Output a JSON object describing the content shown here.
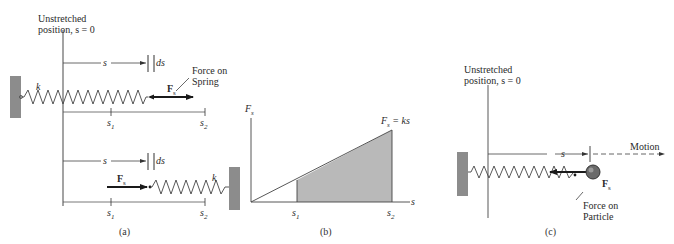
{
  "panel_a": {
    "unstretched_line1": "Unstretched",
    "unstretched_line2": "position, s = 0",
    "spring_constant": "k",
    "displacement": "s",
    "differential": "ds",
    "force_label_main": "F",
    "force_label_sub": "s",
    "force_note_line1": "Force on",
    "force_note_line2": "Spring",
    "s1_main": "s",
    "s1_sub": "1",
    "s2_main": "s",
    "s2_sub": "2",
    "caption": "(a)"
  },
  "panel_b": {
    "y_axis_main": "F",
    "y_axis_sub": "s",
    "x_axis": "s",
    "equation_main": "F",
    "equation_sub": "s",
    "equation_rest": " = ks",
    "s1_main": "s",
    "s1_sub": "1",
    "s2_main": "s",
    "s2_sub": "2",
    "caption": "(b)",
    "shade_color": "#b9b9b9"
  },
  "panel_c": {
    "unstretched_line1": "Unstretched",
    "unstretched_line2": "position, s = 0",
    "displacement": "s",
    "motion": "Motion",
    "force_label_main": "F",
    "force_label_sub": "s",
    "force_note_line1": "Force on",
    "force_note_line2": "Particle",
    "caption": "(c)"
  },
  "colors": {
    "wall": "#8c8c8c",
    "line": "#555555",
    "arrow": "#1a1a1a",
    "ball": "#6a6a6a"
  }
}
